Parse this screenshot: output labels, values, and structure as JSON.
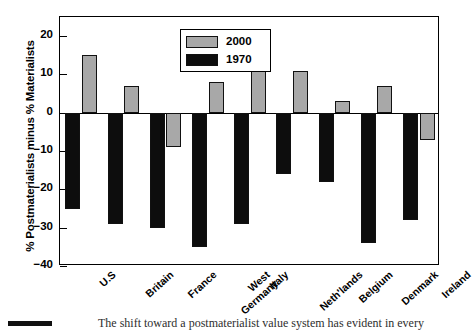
{
  "chart_data": {
    "type": "bar",
    "title": "",
    "xlabel": "",
    "ylabel": "% Postmaterialists minus % Materialists",
    "ylim": [
      -40,
      25
    ],
    "yticks": [
      20,
      10,
      0,
      -10,
      -20,
      -30,
      -40
    ],
    "ytick_labels": [
      "20",
      "10",
      "0",
      "−10",
      "−20",
      "−30",
      "−40"
    ],
    "grid": false,
    "legend_position": "top-center",
    "categories": [
      "U.S",
      "Britain",
      "France",
      "West\nGermany",
      "Italy",
      "Neth'lands",
      "Belgium",
      "Denmark",
      "Ireland"
    ],
    "series": [
      {
        "name": "1970",
        "color": "#0d0d0d",
        "values": [
          -25,
          -29,
          -30,
          -35,
          -29,
          -16,
          -18,
          -34,
          -28
        ]
      },
      {
        "name": "2000",
        "color": "#a8a8a8",
        "values": [
          15,
          7,
          -9,
          8,
          14,
          11,
          3,
          7,
          -7
        ]
      }
    ]
  },
  "legend": {
    "entries": [
      {
        "label": "2000",
        "swatch": "gray"
      },
      {
        "label": "1970",
        "swatch": "black"
      }
    ]
  },
  "caption": {
    "fragment": "The shift toward a postmaterialist value system has evident in every"
  }
}
